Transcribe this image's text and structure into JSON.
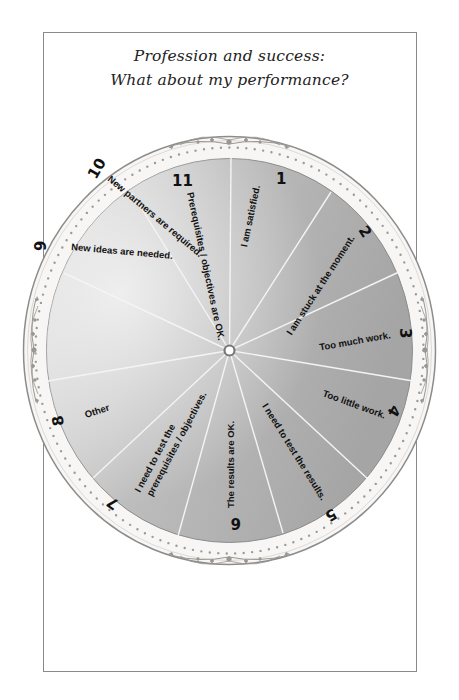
{
  "title": {
    "line1": "Profession and success:",
    "line2": "What about my performance?"
  },
  "wheel": {
    "segment_count": 11,
    "colors": {
      "segment_fill": "#a9a9a9",
      "segment_light": "#e6e6e6",
      "spoke": "#f4f4f4",
      "rim_fill": "#f7f6f4",
      "rim_stroke": "#8c8c8c",
      "rim_dot": "#9a9a9a",
      "hub": "#777777"
    },
    "segments": [
      {
        "number": "1",
        "label": "I am satisfied."
      },
      {
        "number": "2",
        "label": "I am stuck at the moment."
      },
      {
        "number": "3",
        "label": "Too much work."
      },
      {
        "number": "4",
        "label": "Too little work."
      },
      {
        "number": "5",
        "label": "I need to test the results."
      },
      {
        "number": "6",
        "label": "The results are OK."
      },
      {
        "number": "7",
        "label_line1": "I need to test the",
        "label_line2": "prerequisites / objectives."
      },
      {
        "number": "8",
        "label": "Other"
      },
      {
        "number": "9",
        "label": "New ideas are needed."
      },
      {
        "number": "10",
        "label": "New partners are required."
      },
      {
        "number": "11",
        "label": "Prerequisites / objectives are OK."
      }
    ]
  }
}
